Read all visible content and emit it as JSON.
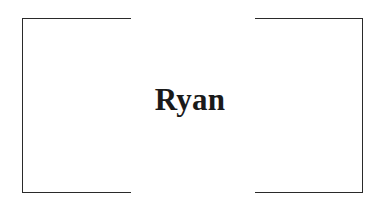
{
  "card": {
    "name": "Ryan"
  },
  "colors": {
    "text": "#1a1a1a",
    "frame": "#2a2a2a",
    "background": "#ffffff"
  }
}
